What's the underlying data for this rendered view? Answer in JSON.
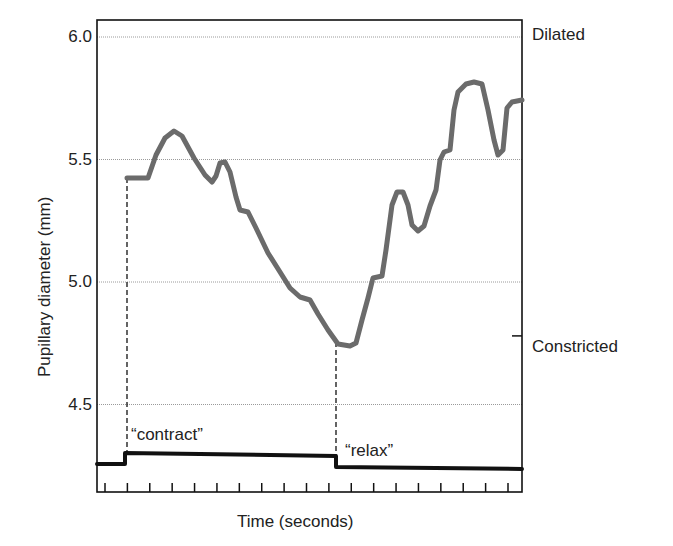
{
  "chart_data": {
    "type": "line",
    "title": "",
    "xlabel": "Time (seconds)",
    "ylabel": "Pupillary diameter (mm)",
    "ylim": [
      4.2,
      6.07
    ],
    "yticks": [
      6.0,
      5.5,
      5.0,
      4.5
    ],
    "ytick_labels": [
      "6.0",
      "5.5",
      "5.0",
      "4.5"
    ],
    "grid": "horizontal dotted lines at y ticks",
    "x_tick_count": 19,
    "right_annotations": [
      {
        "label": "Dilated",
        "y": 6.0
      },
      {
        "label": "Constricted",
        "y": 4.78
      }
    ],
    "event_annotations": [
      {
        "label": "“contract”",
        "x_px": 127
      },
      {
        "label": "“relax”",
        "x_px": 336
      }
    ],
    "series": [
      {
        "name": "Pupillary diameter",
        "color": "#6b6b6b",
        "points_px": [
          [
            127,
            178
          ],
          [
            148,
            178
          ],
          [
            156,
            155
          ],
          [
            165,
            138
          ],
          [
            174,
            131
          ],
          [
            182,
            136
          ],
          [
            194,
            158
          ],
          [
            205,
            175
          ],
          [
            212,
            182
          ],
          [
            216,
            176
          ],
          [
            220,
            163
          ],
          [
            225,
            162
          ],
          [
            230,
            172
          ],
          [
            236,
            197
          ],
          [
            240,
            210
          ],
          [
            248,
            212
          ],
          [
            256,
            228
          ],
          [
            268,
            253
          ],
          [
            280,
            272
          ],
          [
            290,
            288
          ],
          [
            300,
            297
          ],
          [
            310,
            300
          ],
          [
            318,
            314
          ],
          [
            328,
            330
          ],
          [
            338,
            344
          ],
          [
            350,
            346
          ],
          [
            356,
            343
          ],
          [
            362,
            320
          ],
          [
            368,
            298
          ],
          [
            373,
            278
          ],
          [
            382,
            276
          ],
          [
            386,
            250
          ],
          [
            392,
            205
          ],
          [
            397,
            192
          ],
          [
            403,
            192
          ],
          [
            408,
            205
          ],
          [
            412,
            225
          ],
          [
            418,
            231
          ],
          [
            424,
            226
          ],
          [
            430,
            206
          ],
          [
            436,
            190
          ],
          [
            440,
            160
          ],
          [
            444,
            152
          ],
          [
            450,
            150
          ],
          [
            454,
            110
          ],
          [
            458,
            92
          ],
          [
            466,
            84
          ],
          [
            474,
            82
          ],
          [
            482,
            84
          ],
          [
            488,
            110
          ],
          [
            494,
            140
          ],
          [
            498,
            155
          ],
          [
            503,
            150
          ],
          [
            507,
            108
          ],
          [
            512,
            102
          ],
          [
            522,
            100
          ]
        ],
        "values_mm_approx": [
          5.42,
          5.42,
          5.52,
          5.59,
          5.62,
          5.6,
          5.51,
          5.44,
          5.41,
          5.44,
          5.49,
          5.49,
          5.45,
          5.35,
          5.3,
          5.29,
          5.23,
          5.13,
          5.05,
          4.98,
          4.95,
          4.93,
          4.88,
          4.81,
          4.75,
          4.75,
          4.76,
          4.85,
          4.94,
          5.02,
          5.02,
          5.13,
          5.31,
          5.37,
          5.37,
          5.31,
          5.23,
          5.21,
          5.23,
          5.31,
          5.37,
          5.5,
          5.53,
          5.54,
          5.7,
          5.77,
          5.8,
          5.81,
          5.8,
          5.7,
          5.58,
          5.51,
          5.53,
          5.7,
          5.73,
          5.74
        ]
      },
      {
        "name": "Command signal",
        "color": "#111111",
        "points_px": [
          [
            97,
            464
          ],
          [
            125,
            464
          ],
          [
            125,
            453
          ],
          [
            336,
            456
          ],
          [
            336,
            467
          ],
          [
            522,
            469
          ]
        ]
      }
    ]
  },
  "axes": {
    "ytick_labels": [
      "6.0",
      "5.5",
      "5.0",
      "4.5"
    ],
    "ylabel": "Pupillary diameter (mm)",
    "xlabel": "Time (seconds)"
  },
  "annotations": {
    "dilated": "Dilated",
    "constricted": "Constricted",
    "contract": "“contract”",
    "relax": "“relax”"
  }
}
